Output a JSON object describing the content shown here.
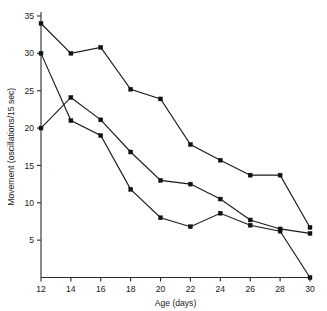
{
  "chart_data": {
    "type": "line",
    "title": "",
    "xlabel": "Age (days)",
    "ylabel": "Movement (oscillations/15 sec)",
    "x": [
      12,
      14,
      16,
      18,
      20,
      22,
      24,
      26,
      28,
      30
    ],
    "xtick_labels": [
      "12",
      "14",
      "16",
      "18",
      "20",
      "22",
      "24",
      "26",
      "28",
      "30"
    ],
    "ytick_labels": [
      "5",
      "10",
      "15",
      "20",
      "25",
      "30",
      "35"
    ],
    "yticks": [
      5,
      10,
      15,
      20,
      25,
      30,
      35
    ],
    "xlim": [
      12,
      30
    ],
    "ylim": [
      0,
      36
    ],
    "grid": false,
    "legend": "none",
    "marker": "square",
    "series": [
      {
        "name": "series-1",
        "values": [
          34.0,
          30.0,
          30.8,
          25.2,
          23.9,
          17.8,
          15.7,
          13.7,
          13.7,
          6.7
        ]
      },
      {
        "name": "series-2",
        "values": [
          20.0,
          24.1,
          21.1,
          16.8,
          13.0,
          12.5,
          10.5,
          7.7,
          6.5,
          5.9
        ]
      },
      {
        "name": "series-3",
        "values": [
          30.0,
          21.0,
          19.0,
          11.8,
          8.0,
          6.8,
          8.6,
          7.0,
          6.2,
          0.0
        ]
      }
    ]
  }
}
